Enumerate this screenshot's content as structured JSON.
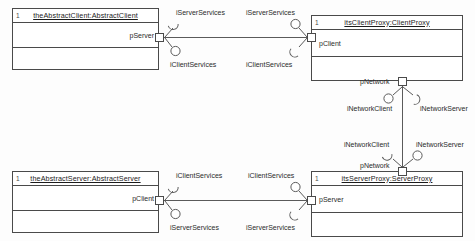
{
  "diagram": {
    "background_color": "#fdfdfd",
    "line_color": "#4a4a4a"
  },
  "components": [
    {
      "id": "abstract-client",
      "stereotype": "1",
      "name": "theAbstractClient:AbstractClient",
      "port": "pServer"
    },
    {
      "id": "client-proxy",
      "stereotype": "1",
      "name": "itsClientProxy:ClientProxy",
      "port": "pClient",
      "port2": "pNetwork"
    },
    {
      "id": "abstract-server",
      "stereotype": "1",
      "name": "theAbstractServer:AbstractServer",
      "port": "pClient"
    },
    {
      "id": "server-proxy",
      "stereotype": "1",
      "name": "itsServerProxy:ServerProxy",
      "port": "pServer",
      "port2": "pNetwork"
    }
  ],
  "interfaces": {
    "top_connector": {
      "left_upper": "iServerServices",
      "left_lower": "iClientServices",
      "right_upper": "iServerServices",
      "right_lower": "iClientServices"
    },
    "bottom_connector": {
      "left_upper": "iClientServices",
      "left_lower": "iServerServices",
      "right_upper": "iClientServices",
      "right_lower": "iServerServices"
    },
    "network_connector": {
      "top_left": "iNetworkClient",
      "top_right": "iNetworkServer",
      "bottom_left": "iNetworkClient",
      "bottom_right": "iNetworkServer"
    }
  }
}
